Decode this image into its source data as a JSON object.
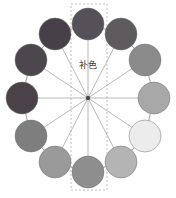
{
  "figure": {
    "name": "color-wheel-complementary-diagram",
    "background": "#ffffff",
    "width": 176,
    "height": 198,
    "label": {
      "text": "补色",
      "meaning": "complementary-color",
      "x": 88,
      "y": 68,
      "color": "#3a3a3a",
      "font_size": 9
    },
    "center_point": {
      "x": 88,
      "y": 98,
      "color": "#4a4a4a",
      "size": 3
    },
    "highlight_rect": {
      "name": "complementary-axis-dashed-rect",
      "x": 71,
      "y": 4,
      "width": 36,
      "height": 186,
      "stroke": "#b0b0b0",
      "dash": "2 2"
    },
    "ring": {
      "center_x": 88,
      "center_y": 98,
      "radius_x": 66,
      "radius_y": 79,
      "circle_radius": 16,
      "outline_stroke": "#8a8a8a",
      "spoke_stroke": "#9a9a9a",
      "circle_stroke": "#707070"
    }
  },
  "chart_data": {
    "type": "pie",
    "title": "补色",
    "xlabel": "",
    "ylabel": "",
    "legend_position": "none",
    "grid": false,
    "categories": [
      "12 o'clock",
      "1 o'clock",
      "2 o'clock",
      "3 o'clock",
      "4 o'clock",
      "5 o'clock",
      "6 o'clock",
      "7 o'clock",
      "8 o'clock",
      "9 o'clock",
      "10 o'clock",
      "11 o'clock"
    ],
    "values": [
      30,
      30,
      30,
      30,
      30,
      30,
      30,
      30,
      30,
      30,
      30,
      30
    ],
    "swatches": [
      {
        "index": 0,
        "position": "12 o'clock",
        "angle_deg": 0,
        "color": "#565059",
        "x": 88,
        "y": 24
      },
      {
        "index": 1,
        "position": "1 o'clock",
        "angle_deg": 30,
        "color": "#5e5a5e",
        "x": 121,
        "y": 34
      },
      {
        "index": 2,
        "position": "2 o'clock",
        "angle_deg": 60,
        "color": "#8b8b8b",
        "x": 145,
        "y": 60
      },
      {
        "index": 3,
        "position": "3 o'clock",
        "angle_deg": 90,
        "color": "#a8a8a8",
        "x": 154,
        "y": 98
      },
      {
        "index": 4,
        "position": "4 o'clock",
        "angle_deg": 120,
        "color": "#ececec",
        "x": 145,
        "y": 136
      },
      {
        "index": 5,
        "position": "5 o'clock",
        "angle_deg": 150,
        "color": "#b4b4b4",
        "x": 121,
        "y": 162
      },
      {
        "index": 6,
        "position": "6 o'clock",
        "angle_deg": 180,
        "color": "#8e8e8e",
        "x": 88,
        "y": 172
      },
      {
        "index": 7,
        "position": "7 o'clock",
        "angle_deg": 210,
        "color": "#9a9a9a",
        "x": 55,
        "y": 162
      },
      {
        "index": 8,
        "position": "8 o'clock",
        "angle_deg": 240,
        "color": "#7e7e7e",
        "x": 31,
        "y": 136
      },
      {
        "index": 9,
        "position": "9 o'clock",
        "angle_deg": 270,
        "color": "#4a4248",
        "x": 22,
        "y": 98
      },
      {
        "index": 10,
        "position": "10 o'clock",
        "angle_deg": 300,
        "color": "#4e464e",
        "x": 31,
        "y": 60
      },
      {
        "index": 11,
        "position": "11 o'clock",
        "angle_deg": 330,
        "color": "#484048",
        "x": 55,
        "y": 34
      }
    ],
    "complementary_pair": {
      "from_index": 0,
      "to_index": 6,
      "axis": "vertical"
    }
  }
}
